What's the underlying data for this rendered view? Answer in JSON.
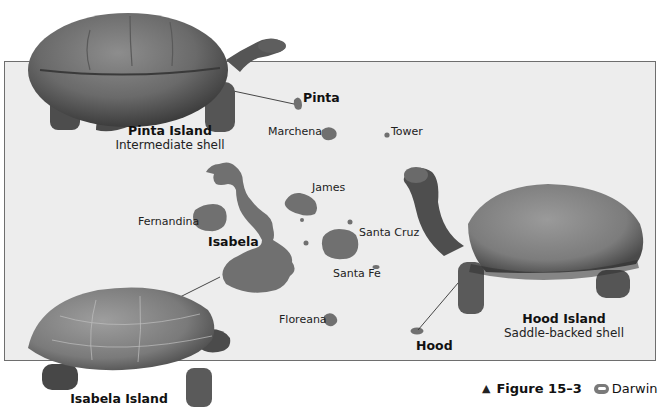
{
  "figure": {
    "number_label": "Figure 15–3",
    "triangle_marker": "▲",
    "link_label": "Darwin",
    "link_icon": "web-link-icon"
  },
  "islands": {
    "pinta": "Pinta",
    "marchena": "Marchena",
    "tower": "Tower",
    "james": "James",
    "fernandina": "Fernandina",
    "isabela": "Isabela",
    "santa_cruz": "Santa Cruz",
    "santa_fe": "Santa Fe",
    "floreana": "Floreana",
    "hood": "Hood"
  },
  "tortoises": {
    "pinta": {
      "title": "Pinta Island",
      "subtitle": "Intermediate shell"
    },
    "hood": {
      "title": "Hood Island",
      "subtitle": "Saddle-backed shell"
    },
    "isabela": {
      "title": "Isabela Island"
    }
  },
  "colors": {
    "island_fill": "#707070",
    "map_background": "#ededed",
    "frame_border": "#6e6e6e"
  }
}
